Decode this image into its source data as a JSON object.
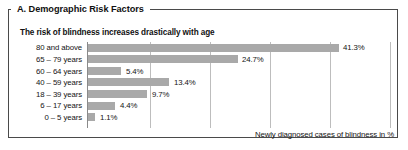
{
  "panel": {
    "title": "A. Demographic Risk Factors",
    "subtitle": "The risk of blindness increases drastically with age"
  },
  "colors": {
    "bar": "#a9a9a9",
    "frame": "#4a4a4a",
    "gridline": "#bdbdbd",
    "axis": "#8a8a8a",
    "text": "#141414"
  },
  "chart_data": {
    "type": "bar",
    "orientation": "horizontal",
    "title": "The risk of blindness increases drastically with age",
    "xlabel": "Newly diagnosed cases of blindness in %",
    "ylabel": "",
    "categories": [
      "80 and above",
      "65 – 79 years",
      "60 – 64 years",
      "40 – 59 years",
      "18 – 39 years",
      "6 – 17 years",
      "0 –  5 years"
    ],
    "values": [
      41.3,
      24.7,
      5.4,
      13.4,
      9.7,
      4.4,
      1.1
    ],
    "value_labels": [
      "41.3%",
      "24.7%",
      "5.4%",
      "13.4%",
      "9.7%",
      "4.4%",
      "1.1%"
    ],
    "xlim": [
      0,
      50
    ],
    "gridline_values": [
      10.4,
      20.3,
      30.2,
      40.1,
      50.0
    ],
    "grid": true,
    "legend": "none"
  },
  "axis_caption": "Newly diagnosed cases of blindness in %"
}
